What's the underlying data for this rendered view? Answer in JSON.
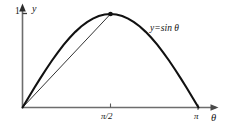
{
  "figure": {
    "background_color": "#ffffff",
    "curve_color": "#111111",
    "chord_color": "#333333",
    "axis_color": "#6d6d6d",
    "text_color": "#141414"
  },
  "labels": {
    "y_axis": "y",
    "y_tick_one": "1",
    "x_axis": "θ",
    "x_tick_half_pi": "π/2",
    "x_tick_pi": "π",
    "curve_equation": "y=sin θ"
  },
  "chart_data": {
    "type": "line",
    "title": "",
    "xlabel": "θ",
    "ylabel": "y",
    "xlim": [
      0,
      3.14159
    ],
    "ylim": [
      0,
      1.05
    ],
    "grid": false,
    "legend": "none",
    "annotations": [
      {
        "text": "y=sin θ",
        "x": 2.05,
        "y": 0.84,
        "name": "curve-equation-annotation"
      }
    ],
    "xticks": [
      {
        "value": 0,
        "label": ""
      },
      {
        "value": 1.5708,
        "label": "π/2"
      },
      {
        "value": 3.14159,
        "label": "π"
      }
    ],
    "yticks": [
      {
        "value": 1,
        "label": "1"
      }
    ],
    "markers": [
      {
        "x": 1.5708,
        "y": 1.0,
        "name": "peak-point",
        "style": "filled-dot"
      }
    ],
    "series": [
      {
        "name": "y=sin θ",
        "style": "solid-thick",
        "color": "#111111",
        "x": [
          0.0,
          0.1047,
          0.2094,
          0.3142,
          0.4189,
          0.5236,
          0.6283,
          0.733,
          0.8378,
          0.9425,
          1.0472,
          1.1519,
          1.2566,
          1.3614,
          1.4661,
          1.5708,
          1.6755,
          1.7802,
          1.885,
          1.9897,
          2.0944,
          2.1991,
          2.3038,
          2.4086,
          2.5133,
          2.618,
          2.7227,
          2.8274,
          2.9322,
          3.0369,
          3.1416
        ],
        "values": [
          0.0,
          0.1045,
          0.2079,
          0.309,
          0.4067,
          0.5,
          0.5878,
          0.6691,
          0.7431,
          0.809,
          0.866,
          0.9135,
          0.9511,
          0.9781,
          0.9945,
          1.0,
          0.9945,
          0.9781,
          0.9511,
          0.9135,
          0.866,
          0.809,
          0.7431,
          0.6691,
          0.5878,
          0.5,
          0.4067,
          0.309,
          0.2079,
          0.1045,
          0.0
        ]
      },
      {
        "name": "chord-origin-to-peak",
        "style": "solid-thin",
        "color": "#333333",
        "x": [
          0.0,
          1.5708
        ],
        "values": [
          0.0,
          1.0
        ]
      }
    ]
  }
}
